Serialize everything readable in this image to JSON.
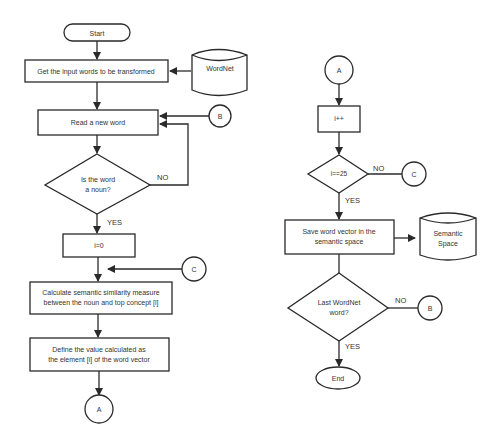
{
  "diagram": {
    "type": "flowchart",
    "left_column": {
      "start": "Start",
      "get_input": "Get the input words to be transformed",
      "wordnet_db": "WordNet",
      "read_word": "Read a new word",
      "connector_b_in": "B",
      "decision_noun_line1": "Is the word",
      "decision_noun_line2": "a noun?",
      "no_label": "NO",
      "yes_label": "YES",
      "init_i": "i=0",
      "connector_c_in": "C",
      "calc_line1": "Calculate semantic similarity measure",
      "calc_line2": "between the noun and top concept [i]",
      "define_line1": "Define the value calculated as",
      "define_line2": "the element [i] of the word vector",
      "connector_a_out": "A"
    },
    "right_column": {
      "connector_a_in": "A",
      "increment": "i++",
      "decision_i": "i==25",
      "no_label_1": "NO",
      "connector_c_out": "C",
      "yes_label_1": "YES",
      "save_line1": "Save word vector in the",
      "save_line2": "semantic space",
      "semantic_db_line1": "Semantic",
      "semantic_db_line2": "Space",
      "decision_last_line1": "Last WordNet",
      "decision_last_line2": "word?",
      "no_label_2": "NO",
      "connector_b_out": "B",
      "yes_label_2": "YES",
      "end": "End"
    }
  }
}
